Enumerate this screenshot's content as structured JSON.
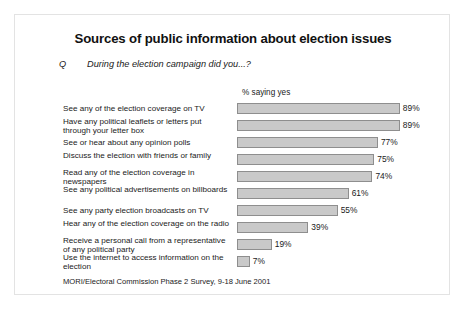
{
  "slide": {
    "title": "Sources of public information about election issues",
    "question_marker": "Q",
    "question_text": "During the election campaign did you...?",
    "axis_caption": "% saying yes",
    "source": "MORI/Electoral Commission Phase 2 Survey, 9-18 June 2001"
  },
  "chart_data": {
    "type": "bar",
    "orientation": "horizontal",
    "title": "Sources of public information about election issues",
    "subtitle": "During the election campaign did you...?",
    "xlabel": "% saying yes",
    "ylabel": "",
    "xlim": [
      0,
      100
    ],
    "grid": false,
    "legend": false,
    "value_suffix": "%",
    "bar_color": "#c9c9c9",
    "bar_border_color": "#8e8e8e",
    "categories": [
      "See any of the election coverage on TV",
      "Have any political leaflets or letters put through your letter box",
      "See or hear about any opinion polls",
      "Discuss the election with friends or family",
      "Read any of the election coverage in newspapers",
      "See any political advertisements on billboards",
      "See any party election broadcasts on TV",
      "Hear any of the election coverage on the radio",
      "Receive a personal call from a representative of any political party",
      "Use the internet to access information on the election"
    ],
    "values": [
      89,
      89,
      77,
      75,
      74,
      61,
      55,
      39,
      19,
      7
    ],
    "value_labels": [
      "89%",
      "89%",
      "77%",
      "75%",
      "74%",
      "61%",
      "55%",
      "39%",
      "19%",
      "7%"
    ]
  }
}
